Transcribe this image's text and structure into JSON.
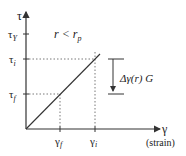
{
  "diagram": {
    "y_axis": {
      "symbol": "τ",
      "ticks": [
        {
          "id": "tau_Y",
          "base": "τ",
          "sub": "Y"
        },
        {
          "id": "tau_i",
          "base": "τ",
          "sub": "i"
        },
        {
          "id": "tau_f",
          "base": "τ",
          "sub": "f"
        }
      ]
    },
    "x_axis": {
      "symbol": "γ",
      "label": "(strain)",
      "ticks": [
        {
          "id": "gamma_f",
          "base": "γ",
          "sub": "f"
        },
        {
          "id": "gamma_i",
          "base": "γ",
          "sub": "i"
        }
      ]
    },
    "condition": {
      "lhs": "r",
      "op": " < ",
      "rhs_base": "r",
      "rhs_sub": "p"
    },
    "annotation": {
      "text": "Δγ(r) G"
    },
    "colors": {
      "line": "#333333",
      "dotted": "#555555",
      "text": "#222222"
    }
  }
}
